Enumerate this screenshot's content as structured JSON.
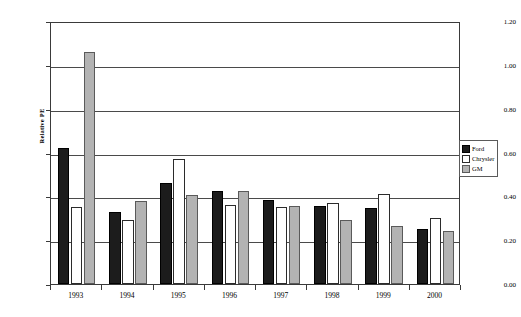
{
  "chart_data": {
    "type": "bar",
    "title": "",
    "xlabel": "",
    "ylabel": "Relative PE",
    "ylim": [
      0.0,
      1.2
    ],
    "ytick_labels": [
      "0.00",
      "0.20",
      "0.40",
      "0.60",
      "0.80",
      "1.00",
      "1.20"
    ],
    "ytick_values": [
      0.0,
      0.2,
      0.4,
      0.6,
      0.8,
      1.0,
      1.2
    ],
    "grid": true,
    "legend_position": "right",
    "categories": [
      "1993",
      "1994",
      "1995",
      "1996",
      "1997",
      "1998",
      "1999",
      "2000"
    ],
    "series": [
      {
        "name": "Ford",
        "color": "#1c1c1c",
        "values": [
          0.62,
          0.33,
          0.46,
          0.425,
          0.385,
          0.355,
          0.345,
          0.25
        ]
      },
      {
        "name": "Chrysler",
        "color": "#ffffff",
        "values": [
          0.35,
          0.29,
          0.57,
          0.36,
          0.35,
          0.37,
          0.41,
          0.3
        ]
      },
      {
        "name": "GM",
        "color": "#b3b3b3",
        "values": [
          1.06,
          0.38,
          0.405,
          0.425,
          0.355,
          0.29,
          0.265,
          0.24
        ]
      }
    ]
  },
  "legend": {
    "items": [
      {
        "label": "Ford",
        "swatch": "ford"
      },
      {
        "label": "Chrysler",
        "swatch": "chrysler"
      },
      {
        "label": "GM",
        "swatch": "gm"
      }
    ]
  }
}
